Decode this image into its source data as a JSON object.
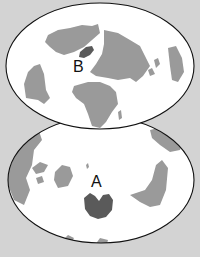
{
  "figure": {
    "colors": {
      "background": "#d3d3d3",
      "ocean": "#ffffff",
      "land": "#9a9a9a",
      "highlight_land": "#5a5a5a",
      "outline": "#111111"
    }
  },
  "maps": [
    {
      "id": "top",
      "label": "B",
      "highlighted_region": "Greenland"
    },
    {
      "id": "bottom",
      "label": "A",
      "highlighted_region": "Antarctica"
    }
  ]
}
